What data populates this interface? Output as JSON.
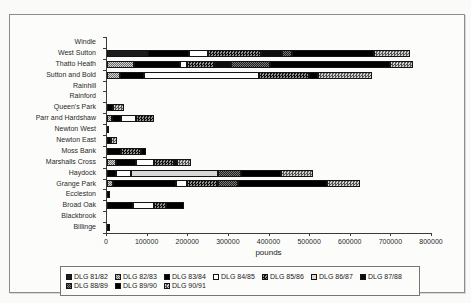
{
  "caption_fragment": "g",
  "colors": {
    "background": "#fafaf8",
    "figure_border": "#8c8c8c",
    "axis": "#3a3a3a",
    "bar_black": "#000000",
    "bar_white": "#fdfdfd",
    "bar_light_gray": "#d8d8d8",
    "checker_gray": "#888888"
  },
  "chart_data": {
    "type": "bar",
    "orientation": "horizontal",
    "stacked": true,
    "title": "",
    "xlabel": "pounds",
    "ylabel": "",
    "xlim": [
      0,
      800000
    ],
    "xticks": [
      0,
      100000,
      200000,
      300000,
      400000,
      500000,
      600000,
      700000,
      800000
    ],
    "grid": false,
    "legend_position": "bottom-box",
    "categories": [
      "Windle",
      "West Sutton",
      "Thatto Heath",
      "Sutton and Bold",
      "Rainhill",
      "Rainford",
      "Queen's Park",
      "Parr and Hardshaw",
      "Newton West",
      "Newton East",
      "Moss Bank",
      "Marshalls Cross",
      "Haydock",
      "Grange Park",
      "Eccleston",
      "Broad Oak",
      "Blackbrook",
      "Billinge"
    ],
    "series": [
      {
        "name": "DLG 81/82",
        "pattern": "dark-solid",
        "values": [
          0,
          100000,
          0,
          0,
          0,
          0,
          0,
          0,
          0,
          0,
          0,
          0,
          0,
          0,
          0,
          0,
          0,
          0
        ]
      },
      {
        "name": "DLG 82/83",
        "pattern": "medium-checker",
        "values": [
          0,
          0,
          67000,
          33000,
          0,
          0,
          0,
          12000,
          0,
          0,
          0,
          22000,
          0,
          15000,
          0,
          0,
          0,
          0
        ]
      },
      {
        "name": "DLG 83/84",
        "pattern": "black-solid",
        "values": [
          0,
          101000,
          113000,
          58000,
          0,
          0,
          0,
          22000,
          5000,
          0,
          34000,
          49000,
          22000,
          154000,
          7000,
          64000,
          0,
          7000
        ]
      },
      {
        "name": "DLG 84/85",
        "pattern": "white",
        "values": [
          0,
          47000,
          16000,
          282000,
          0,
          0,
          0,
          37000,
          0,
          0,
          0,
          45000,
          37000,
          29000,
          0,
          51000,
          0,
          0
        ]
      },
      {
        "name": "DLG 85/86",
        "pattern": "dark-checker",
        "values": [
          0,
          130000,
          71000,
          125000,
          0,
          0,
          0,
          44000,
          0,
          0,
          49000,
          49000,
          0,
          76000,
          0,
          29000,
          0,
          0
        ]
      },
      {
        "name": "DLG 86/87",
        "pattern": "light-gray",
        "values": [
          0,
          0,
          0,
          0,
          0,
          0,
          0,
          0,
          0,
          0,
          0,
          0,
          215000,
          0,
          0,
          0,
          0,
          0
        ]
      },
      {
        "name": "DLG 87/88",
        "pattern": "black-solid",
        "values": [
          0,
          53000,
          37000,
          0,
          0,
          0,
          0,
          0,
          0,
          0,
          0,
          8000,
          0,
          0,
          0,
          0,
          0,
          0
        ]
      },
      {
        "name": "DLG 88/89",
        "pattern": "dark-gray-checker",
        "values": [
          0,
          25000,
          98000,
          0,
          0,
          0,
          0,
          0,
          0,
          0,
          0,
          0,
          55000,
          49000,
          0,
          0,
          0,
          0
        ]
      },
      {
        "name": "DLG 89/90",
        "pattern": "black-solid",
        "values": [
          0,
          201000,
          294000,
          22000,
          0,
          0,
          15000,
          0,
          0,
          10000,
          12000,
          0,
          100000,
          218000,
          0,
          46000,
          0,
          0
        ]
      },
      {
        "name": "DLG 90/91",
        "pattern": "coarse-checker",
        "values": [
          0,
          88000,
          56000,
          132000,
          0,
          0,
          27000,
          0,
          0,
          15000,
          0,
          33000,
          78000,
          81000,
          0,
          0,
          0,
          0
        ]
      }
    ]
  }
}
